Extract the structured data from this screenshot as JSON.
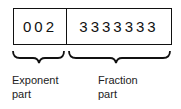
{
  "register": {
    "exponent_value": "002",
    "fraction_value": "3333333"
  },
  "labels": {
    "exponent_line1": "Exponent",
    "exponent_line2": "part",
    "fraction_line1": "Fraction",
    "fraction_line2": "part"
  }
}
